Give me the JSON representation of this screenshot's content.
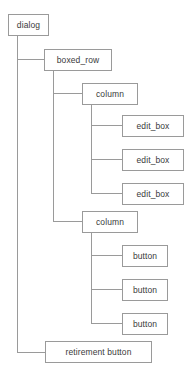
{
  "diagram": {
    "type": "tree",
    "colors": {
      "border": "#9a9a9a",
      "fill": "#ffffff",
      "text": "#3a3a3a",
      "connector": "#9a9a9a",
      "background": "#ffffff"
    },
    "nodes": [
      {
        "id": "dialog",
        "label": "dialog",
        "depth": 0
      },
      {
        "id": "boxed_row",
        "label": "boxed_row",
        "depth": 1
      },
      {
        "id": "column1",
        "label": "column",
        "depth": 2
      },
      {
        "id": "edit_box1",
        "label": "edit_box",
        "depth": 3
      },
      {
        "id": "edit_box2",
        "label": "edit_box",
        "depth": 3
      },
      {
        "id": "edit_box3",
        "label": "edit_box",
        "depth": 3
      },
      {
        "id": "column2",
        "label": "column",
        "depth": 2
      },
      {
        "id": "button1",
        "label": "button",
        "depth": 3
      },
      {
        "id": "button2",
        "label": "button",
        "depth": 3
      },
      {
        "id": "button3",
        "label": "button",
        "depth": 3
      },
      {
        "id": "retirement",
        "label": "retirement button",
        "depth": 1
      }
    ]
  }
}
